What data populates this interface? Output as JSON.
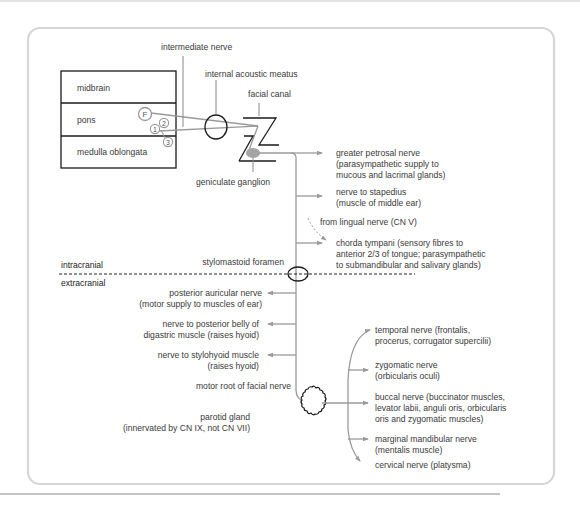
{
  "diagram": {
    "brainstem": {
      "midbrain": "midbrain",
      "pons": "pons",
      "medulla": "medulla oblongata"
    },
    "nuclei": [
      "F",
      "1",
      "2",
      "3"
    ],
    "labels": {
      "intermediate_nerve": "intermediate nerve",
      "internal_acoustic_meatus": "internal acoustic meatus",
      "facial_canal": "facial canal",
      "geniculate_ganglion": "geniculate ganglion",
      "stylomastoid_foramen": "stylomastoid foramen",
      "intracranial": "intracranial",
      "extracranial": "extracranial",
      "from_lingual": "from lingual nerve (CN V)",
      "motor_root": "motor root of facial nerve",
      "parotid_1": "parotid gland",
      "parotid_2": "(innervated by CN IX, not CN VII)"
    },
    "intracranial_branches": [
      {
        "line1": "greater petrosal nerve",
        "line2": "(parasympathetic supply to",
        "line3": "mucous and lacrimal glands)"
      },
      {
        "line1": "nerve to stapedius",
        "line2": "(muscle of middle ear)"
      },
      {
        "line1": "chorda tympani (sensory fibres to",
        "line2": "anterior 2/3 of tongue; parasympathetic",
        "line3": "to submandibular and salivary glands)"
      }
    ],
    "extracranial_branches": [
      {
        "line1": "posterior auricular nerve",
        "line2": "(motor supply to muscles of ear)"
      },
      {
        "line1": "nerve to posterior belly of",
        "line2": "digastric muscle (raises hyoid)"
      },
      {
        "line1": "nerve to stylohyoid muscle",
        "line2": "(raises hyoid)"
      }
    ],
    "terminal_branches": [
      {
        "line1": "temporal nerve (frontalis,",
        "line2": "procerus, corrugator supercilii)"
      },
      {
        "line1": "zygomatic nerve",
        "line2": "(orbicularis oculi)"
      },
      {
        "line1": "buccal nerve (buccinator muscles,",
        "line2": "levator labii, anguli oris, orbicularis",
        "line3": "oris and zygomatic muscles)"
      },
      {
        "line1": "marginal mandibular nerve",
        "line2": "(mentalis muscle)"
      },
      {
        "line1": "cervical nerve (platysma)"
      }
    ]
  }
}
